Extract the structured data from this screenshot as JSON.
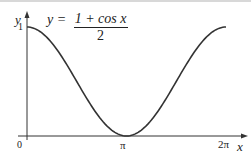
{
  "chart_data": {
    "type": "line",
    "title": "",
    "equation": {
      "lhs": "y = ",
      "numerator": "1 + cos x",
      "denominator": "2"
    },
    "xlabel": "x",
    "ylabel": "y",
    "x_ticks": [
      "0",
      "π",
      "2π"
    ],
    "y_ticks": [
      "1"
    ],
    "xlim": [
      0,
      6.2832
    ],
    "ylim": [
      0,
      1
    ],
    "grid": false,
    "legend": null,
    "series": [
      {
        "name": "y = (1 + cos x)/2",
        "x": [
          0,
          0.7854,
          1.5708,
          2.3562,
          3.1416,
          3.927,
          4.7124,
          5.4978,
          6.2832
        ],
        "y": [
          1,
          0.854,
          0.5,
          0.146,
          0,
          0.146,
          0.5,
          0.854,
          1
        ]
      }
    ],
    "colors": {
      "curve": "#333333",
      "axes": "#333333"
    }
  }
}
